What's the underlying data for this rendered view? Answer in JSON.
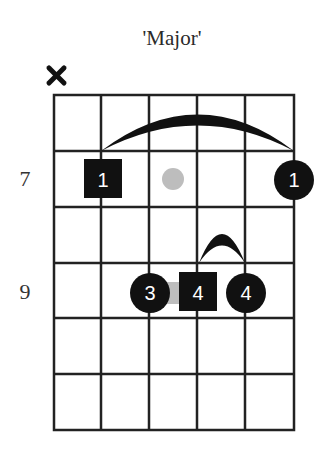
{
  "title": "'Major'",
  "diagram": {
    "type": "guitar-chord-diagram",
    "strings": 6,
    "fret_rows": 6,
    "muted_strings": [
      1
    ],
    "fret_labels": [
      {
        "label": "7",
        "row": 2
      },
      {
        "label": "9",
        "row": 4
      }
    ],
    "markers": [
      {
        "string": 2,
        "row": 2,
        "shape": "square",
        "finger": "1",
        "role": "root"
      },
      {
        "string": 3,
        "row": 2,
        "shape": "gray-dot",
        "finger": ""
      },
      {
        "string": 6,
        "row": 2,
        "shape": "circle",
        "finger": "1"
      },
      {
        "string": 3,
        "row": 4,
        "shape": "circle",
        "finger": "3"
      },
      {
        "string": 4,
        "row": 4,
        "shape": "square",
        "finger": "4",
        "role": "root"
      },
      {
        "string": 5,
        "row": 4,
        "shape": "circle",
        "finger": "4"
      }
    ],
    "barres": [
      {
        "from_string": 2,
        "to_string": 6,
        "row": 2,
        "finger": "1"
      },
      {
        "from_string": 4,
        "to_string": 5,
        "row": 4,
        "finger": "4"
      }
    ],
    "colors": {
      "grid": "#222222",
      "marker": "#111111",
      "marker_text": "#ffffff",
      "ghost_dot": "#bdbdbd"
    }
  },
  "labels": {
    "fret_7": "7",
    "fret_9": "9",
    "m1": "1",
    "m2": "1",
    "m3": "3",
    "m4": "4",
    "m5": "4"
  }
}
